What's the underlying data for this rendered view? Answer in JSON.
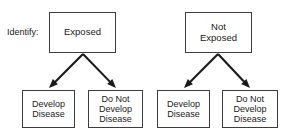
{
  "diagram": {
    "title_label": "Identify:",
    "background_color": "#ffffff",
    "box_border_color": "#3d3d3d",
    "arrow_color": "#1a1a1a",
    "text_color": "#1a1a1a",
    "branches": [
      {
        "id": "exposed",
        "root": {
          "label": "Exposed"
        },
        "children": [
          {
            "id": "exposed-develop",
            "label": "Develop\nDisease"
          },
          {
            "id": "exposed-not-develop",
            "label": "Do Not\nDevelop\nDisease"
          }
        ]
      },
      {
        "id": "not-exposed",
        "root": {
          "label": "Not\nExposed"
        },
        "children": [
          {
            "id": "not-exposed-develop",
            "label": "Develop\nDisease"
          },
          {
            "id": "not-exposed-not-develop",
            "label": "Do Not\nDevelop\nDisease"
          }
        ]
      }
    ]
  },
  "layout": {
    "side_label": {
      "x": 7,
      "y": 27
    },
    "nodes": [
      {
        "name": "exposed-box",
        "x": 49,
        "y": 12,
        "w": 67,
        "h": 41
      },
      {
        "name": "not-exposed-box",
        "x": 185,
        "y": 12,
        "w": 67,
        "h": 41
      },
      {
        "name": "exposed-develop-box",
        "x": 22,
        "y": 90,
        "w": 53,
        "h": 38
      },
      {
        "name": "exposed-not-develop-box",
        "x": 88,
        "y": 90,
        "w": 55,
        "h": 38
      },
      {
        "name": "not-exposed-develop-box",
        "x": 157,
        "y": 90,
        "w": 53,
        "h": 38
      },
      {
        "name": "not-exposed-not-develop-box",
        "x": 222,
        "y": 90,
        "w": 56,
        "h": 38
      }
    ],
    "arrows": [
      {
        "name": "arrow-exposed-to-develop",
        "x1": 83,
        "y1": 54,
        "x2": 49,
        "y2": 88
      },
      {
        "name": "arrow-exposed-to-not-develop",
        "x1": 83,
        "y1": 54,
        "x2": 116,
        "y2": 88
      },
      {
        "name": "arrow-not-exposed-to-develop",
        "x1": 218,
        "y1": 54,
        "x2": 184,
        "y2": 88
      },
      {
        "name": "arrow-not-exposed-to-not-develop",
        "x1": 218,
        "y1": 54,
        "x2": 250,
        "y2": 88
      }
    ]
  }
}
